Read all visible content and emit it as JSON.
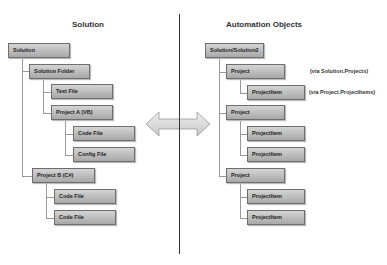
{
  "left": {
    "title": "Solution",
    "nodes": [
      "Solution",
      "Solution Folder",
      "Text File",
      "Project A (VB)",
      "Code File",
      "Config File",
      "Project B (C#)",
      "Code File",
      "Code File"
    ]
  },
  "right": {
    "title": "Automation Objects",
    "nodes": [
      "Solution/Solution2",
      "Project",
      "ProjectItem",
      "Project",
      "ProjectItem",
      "ProjectItem",
      "Project",
      "ProjectItem",
      "ProjectItem"
    ],
    "annotations": [
      "(via Solution.Projects)",
      "(via Project.ProjectItems)"
    ]
  },
  "arrow": {
    "icon": "double-arrow-icon"
  }
}
